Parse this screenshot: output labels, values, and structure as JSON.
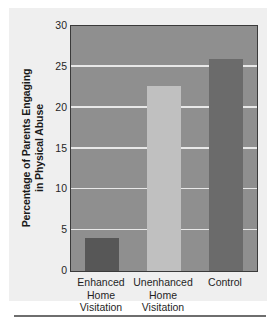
{
  "chart_data": {
    "type": "bar",
    "title": "",
    "xlabel": "",
    "ylabel_line1": "Percentage of Parents Engaging",
    "ylabel_line2": "in Physical Abuse",
    "ylabel": "Percentage of Parents Engaging in Physical Abuse",
    "categories": [
      "Enhanced Home Visitation",
      "Unenhanced Home Visitation",
      "Control"
    ],
    "category_lines": [
      [
        "Enhanced",
        "Home",
        "Visitation"
      ],
      [
        "Unenhanced",
        "Home",
        "Visitation"
      ],
      [
        "Control"
      ]
    ],
    "values": [
      4.0,
      22.7,
      26.0
    ],
    "ylim": [
      0,
      30
    ],
    "yticks": [
      0,
      5,
      10,
      15,
      20,
      25,
      30
    ],
    "ytick_labels": [
      "0",
      "5",
      "10",
      "15",
      "20",
      "25",
      "30"
    ],
    "grid": true,
    "grid_axis": "y",
    "legend": false,
    "bar_colors": [
      "#575757",
      "#c0c0c0",
      "#6b6b6b"
    ],
    "plot_background": "#8f8f8f",
    "gridline_color": "#e8e8e8",
    "axis_color": "#3a3a3a",
    "panel_background": "#efefef",
    "text_color": "#1f1f1f"
  }
}
